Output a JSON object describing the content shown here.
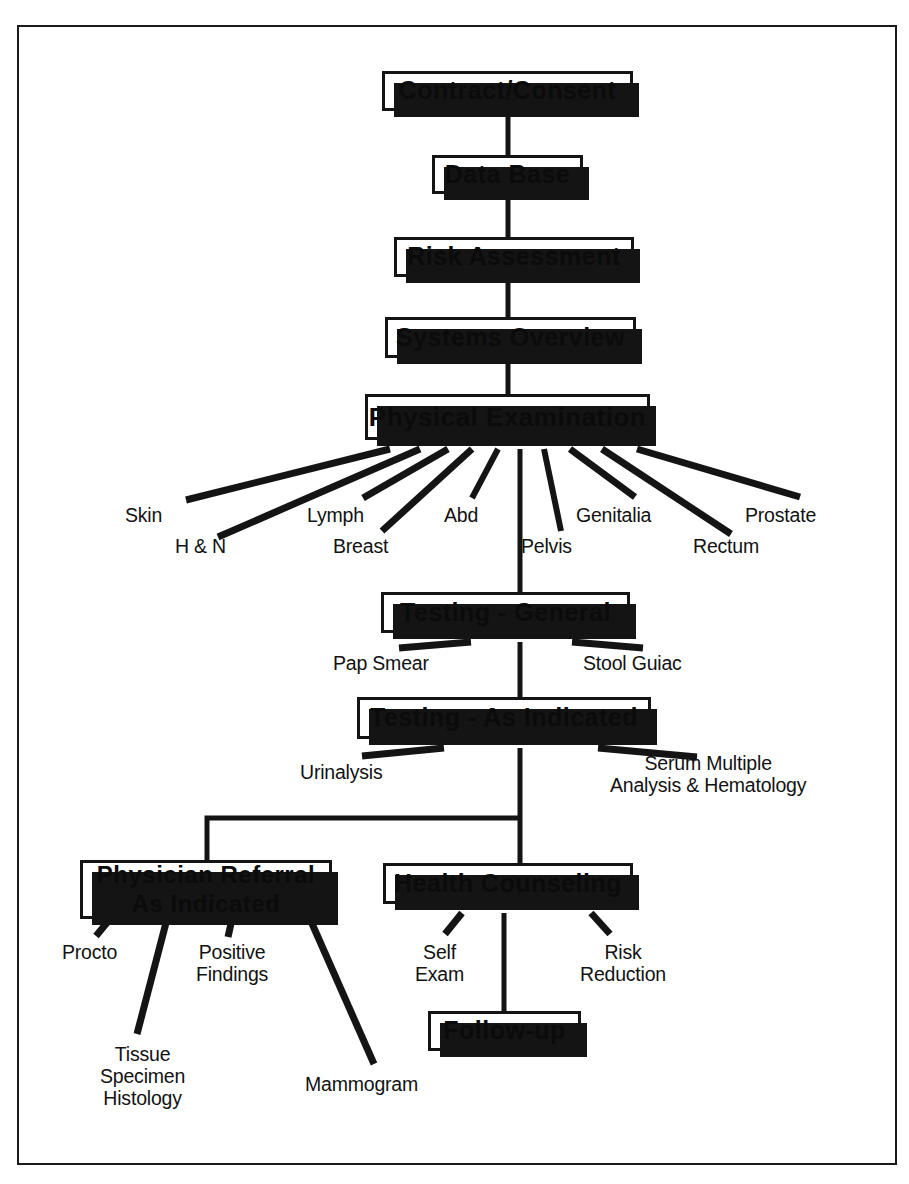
{
  "diagram": {
    "type": "flowchart",
    "orientation": "top-to-bottom",
    "style": {
      "box_fill": "#ffffff",
      "box_border": "#141414",
      "box_shadow": "#141414",
      "line_color": "#141414",
      "text_color": "#111111",
      "frame_border": "#1b1b1b",
      "page_background": "#ffffff"
    }
  },
  "nodes": [
    {
      "id": "contract",
      "label": "Contract/Consent",
      "x": 382,
      "y": 71,
      "w": 251,
      "h": 40,
      "font": 25
    },
    {
      "id": "database",
      "label": "Data Base",
      "x": 432,
      "y": 155,
      "w": 151,
      "h": 39,
      "font": 25
    },
    {
      "id": "risk",
      "label": "Risk Assessment",
      "x": 394,
      "y": 237,
      "w": 240,
      "h": 40,
      "font": 25
    },
    {
      "id": "systems",
      "label": "Systems Overview",
      "x": 385,
      "y": 317,
      "w": 251,
      "h": 41,
      "font": 25
    },
    {
      "id": "physical",
      "label": "Physical Examination",
      "x": 365,
      "y": 394,
      "w": 285,
      "h": 46,
      "font": 26
    },
    {
      "id": "testgen",
      "label": "Testing - General",
      "x": 381,
      "y": 592,
      "w": 249,
      "h": 41,
      "font": 25
    },
    {
      "id": "testind",
      "label": "Testing - As Indicated",
      "x": 357,
      "y": 697,
      "w": 294,
      "h": 42,
      "font": 25
    },
    {
      "id": "referral",
      "label": "Physician Referral\nAs Indicated",
      "x": 80,
      "y": 860,
      "w": 252,
      "h": 59,
      "font": 24
    },
    {
      "id": "counseling",
      "label": "Health Counseling",
      "x": 383,
      "y": 863,
      "w": 250,
      "h": 41,
      "font": 25
    },
    {
      "id": "followup",
      "label": "Follow-up",
      "x": 428,
      "y": 1011,
      "w": 153,
      "h": 40,
      "font": 25
    }
  ],
  "leaf_labels": [
    {
      "id": "skin",
      "text": "Skin",
      "x": 125,
      "y": 505,
      "w": 90,
      "align": "left",
      "parent": "physical"
    },
    {
      "id": "hn",
      "text": "H & N",
      "x": 175,
      "y": 536,
      "w": 100,
      "align": "left",
      "parent": "physical"
    },
    {
      "id": "lymph",
      "text": "Lymph",
      "x": 307,
      "y": 505,
      "w": 100,
      "align": "left",
      "parent": "physical"
    },
    {
      "id": "breast",
      "text": "Breast",
      "x": 333,
      "y": 536,
      "w": 100,
      "align": "left",
      "parent": "physical"
    },
    {
      "id": "abd",
      "text": "Abd",
      "x": 444,
      "y": 505,
      "w": 70,
      "align": "left",
      "parent": "physical"
    },
    {
      "id": "pelvis",
      "text": "Pelvis",
      "x": 521,
      "y": 536,
      "w": 90,
      "align": "left",
      "parent": "physical"
    },
    {
      "id": "genitalia",
      "text": "Genitalia",
      "x": 576,
      "y": 505,
      "w": 110,
      "align": "left",
      "parent": "physical"
    },
    {
      "id": "rectum",
      "text": "Rectum",
      "x": 693,
      "y": 536,
      "w": 110,
      "align": "left",
      "parent": "physical"
    },
    {
      "id": "prostate",
      "text": "Prostate",
      "x": 745,
      "y": 505,
      "w": 120,
      "align": "left",
      "parent": "physical"
    },
    {
      "id": "pap",
      "text": "Pap Smear",
      "x": 333,
      "y": 653,
      "w": 150,
      "align": "left",
      "parent": "testgen"
    },
    {
      "id": "stool",
      "text": "Stool Guiac",
      "x": 583,
      "y": 653,
      "w": 160,
      "align": "left",
      "parent": "testgen"
    },
    {
      "id": "urinalysis",
      "text": "Urinalysis",
      "x": 300,
      "y": 762,
      "w": 140,
      "align": "left",
      "parent": "testind"
    },
    {
      "id": "serum",
      "text": "Serum Multiple\nAnalysis & Hematology",
      "x": 610,
      "y": 753,
      "w": 265,
      "align": "left",
      "parent": "testind"
    },
    {
      "id": "procto",
      "text": "Procto",
      "x": 62,
      "y": 942,
      "w": 100,
      "align": "left",
      "parent": "referral"
    },
    {
      "id": "tissue",
      "text": "Tissue\nSpecimen\nHistology",
      "x": 100,
      "y": 1044,
      "w": 150,
      "align": "left",
      "parent": "referral"
    },
    {
      "id": "positive",
      "text": "Positive\nFindings",
      "x": 196,
      "y": 942,
      "w": 130,
      "align": "left",
      "parent": "referral"
    },
    {
      "id": "mammogram",
      "text": "Mammogram",
      "x": 305,
      "y": 1074,
      "w": 180,
      "align": "left",
      "parent": "referral"
    },
    {
      "id": "selfexam",
      "text": "Self\nExam",
      "x": 415,
      "y": 942,
      "w": 90,
      "align": "left",
      "parent": "counseling"
    },
    {
      "id": "riskred",
      "text": "Risk\nReduction",
      "x": 580,
      "y": 942,
      "w": 150,
      "align": "left",
      "parent": "counseling"
    }
  ],
  "connectors": {
    "spine_x": 520,
    "description": "Vertical trunk connects the main sequence; diagonal spurs fan out to leaf labels.",
    "elbow": {
      "from_x": 520,
      "to_x": 207,
      "y": 818
    }
  }
}
